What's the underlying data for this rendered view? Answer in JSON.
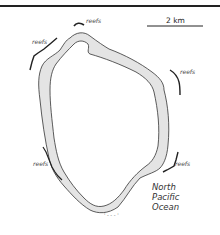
{
  "map": {
    "scale_bar": {
      "label": "2 km"
    },
    "ocean_label": {
      "lines": [
        "North",
        "Pacific",
        "Ocean"
      ]
    },
    "reef_labels": [
      {
        "id": "north",
        "text": "reefs"
      },
      {
        "id": "northwest",
        "text": "reefs"
      },
      {
        "id": "east",
        "text": "reefs"
      },
      {
        "id": "west",
        "text": "reefs"
      },
      {
        "id": "southeast",
        "text": "reefs"
      }
    ],
    "bottom_marker": {
      "text": "' - - - '"
    },
    "colors": {
      "land_fill": "#e4e4e4",
      "outline": "#333333",
      "reef": "#222222",
      "border": "#222222"
    }
  }
}
